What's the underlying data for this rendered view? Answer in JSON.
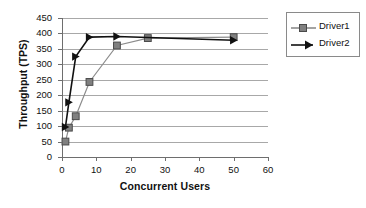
{
  "chart_data": {
    "type": "line",
    "title": "",
    "xlabel": "Concurrent Users",
    "ylabel": "Throughput (TPS)",
    "xlim": [
      0,
      60
    ],
    "ylim": [
      0,
      450
    ],
    "xticks": [
      0,
      10,
      20,
      30,
      40,
      50,
      60
    ],
    "yticks": [
      0,
      50,
      100,
      150,
      200,
      250,
      300,
      350,
      400,
      450
    ],
    "grid": "horizontal",
    "legend_position": "right-outside",
    "series": [
      {
        "name": "Driver1",
        "marker": "square",
        "color": "#808080",
        "line_color": "#8c8c8c",
        "x": [
          1,
          2,
          4,
          8,
          16,
          25,
          50
        ],
        "y": [
          50,
          95,
          132,
          243,
          361,
          385,
          388
        ]
      },
      {
        "name": "Driver2",
        "marker": "triangle-right",
        "color": "#111111",
        "line_color": "#111111",
        "x": [
          1,
          2,
          4,
          8,
          16,
          50
        ],
        "y": [
          97,
          177,
          325,
          388,
          390,
          378
        ]
      }
    ]
  },
  "legend": {
    "entries": [
      {
        "label": "Driver1"
      },
      {
        "label": "Driver2"
      }
    ]
  },
  "axes": {
    "x_tick_labels": [
      "0",
      "10",
      "20",
      "30",
      "40",
      "50",
      "60"
    ],
    "y_tick_labels": [
      "0",
      "50",
      "100",
      "150",
      "200",
      "250",
      "300",
      "350",
      "400",
      "450"
    ],
    "x_title": "Concurrent Users",
    "y_title": "Throughput (TPS)"
  },
  "colors": {
    "driver1": "#808080",
    "driver2": "#111111",
    "grid": "#a8a8a8",
    "axis": "#6e6e6e",
    "background": "#ffffff"
  }
}
